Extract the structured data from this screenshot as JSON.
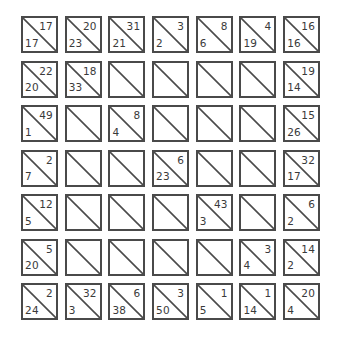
{
  "puzzle": {
    "type": "kakuro-style clue grid",
    "rows": 7,
    "cols": 7,
    "colors": {
      "border": "#4a4a4a",
      "text": "#3a3a3a",
      "background": "#ffffff"
    },
    "cells": [
      [
        {
          "top": "17",
          "bottom": "17"
        },
        {
          "top": "20",
          "bottom": "23"
        },
        {
          "top": "31",
          "bottom": "21"
        },
        {
          "top": "3",
          "bottom": "2"
        },
        {
          "top": "8",
          "bottom": "6"
        },
        {
          "top": "4",
          "bottom": "19"
        },
        {
          "top": "16",
          "bottom": "16"
        }
      ],
      [
        {
          "top": "22",
          "bottom": "20"
        },
        {
          "top": "18",
          "bottom": "33"
        },
        {
          "top": "",
          "bottom": ""
        },
        {
          "top": "",
          "bottom": ""
        },
        {
          "top": "",
          "bottom": ""
        },
        {
          "top": "",
          "bottom": ""
        },
        {
          "top": "19",
          "bottom": "14"
        }
      ],
      [
        {
          "top": "49",
          "bottom": "1"
        },
        {
          "top": "",
          "bottom": ""
        },
        {
          "top": "8",
          "bottom": "4"
        },
        {
          "top": "",
          "bottom": ""
        },
        {
          "top": "",
          "bottom": ""
        },
        {
          "top": "",
          "bottom": ""
        },
        {
          "top": "15",
          "bottom": "26"
        }
      ],
      [
        {
          "top": "2",
          "bottom": "7"
        },
        {
          "top": "",
          "bottom": ""
        },
        {
          "top": "",
          "bottom": ""
        },
        {
          "top": "6",
          "bottom": "23"
        },
        {
          "top": "",
          "bottom": ""
        },
        {
          "top": "",
          "bottom": ""
        },
        {
          "top": "32",
          "bottom": "17"
        }
      ],
      [
        {
          "top": "12",
          "bottom": "5"
        },
        {
          "top": "",
          "bottom": ""
        },
        {
          "top": "",
          "bottom": ""
        },
        {
          "top": "",
          "bottom": ""
        },
        {
          "top": "43",
          "bottom": "3"
        },
        {
          "top": "",
          "bottom": ""
        },
        {
          "top": "6",
          "bottom": "2"
        }
      ],
      [
        {
          "top": "5",
          "bottom": "20"
        },
        {
          "top": "",
          "bottom": ""
        },
        {
          "top": "",
          "bottom": ""
        },
        {
          "top": "",
          "bottom": ""
        },
        {
          "top": "",
          "bottom": ""
        },
        {
          "top": "3",
          "bottom": "4"
        },
        {
          "top": "14",
          "bottom": "2"
        }
      ],
      [
        {
          "top": "2",
          "bottom": "24"
        },
        {
          "top": "32",
          "bottom": "3"
        },
        {
          "top": "6",
          "bottom": "38"
        },
        {
          "top": "3",
          "bottom": "50"
        },
        {
          "top": "1",
          "bottom": "5"
        },
        {
          "top": "1",
          "bottom": "14"
        },
        {
          "top": "20",
          "bottom": "4"
        }
      ]
    ]
  }
}
